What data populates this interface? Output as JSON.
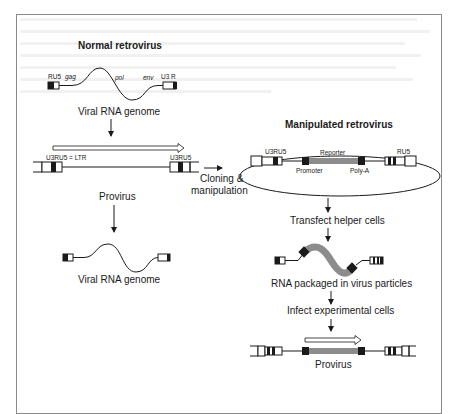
{
  "figure": {
    "left_column": {
      "title": "Normal retrovirus",
      "genome_labels": {
        "left_ltr": "RU5",
        "gag": "gag",
        "pol": "pol",
        "env": "env",
        "right_ltr": "U3 R"
      },
      "viral_rna_label_top": "Viral RNA genome",
      "provirus_ltr_left": "U3RU5 = LTR",
      "provirus_ltr_right": "U3RU5",
      "provirus_label": "Provirus",
      "viral_rna_label_bottom": "Viral RNA genome"
    },
    "transition": {
      "label_line1": "Cloning &",
      "label_line2": "manipulation"
    },
    "right_column": {
      "title": "Manipulated retrovirus",
      "ltr_left": "U3RU5",
      "ltr_right": "RU5",
      "reporter": "Reporter",
      "promoter": "Promoter",
      "polya": "Poly-A",
      "step1": "Transfect helper cells",
      "rna_label": "RNA packaged in virus particles",
      "step2": "Infect experimental cells",
      "provirus_label": "Provirus"
    },
    "colors": {
      "line": "#1a1a1a",
      "reporter_gray": "#8c8c8c",
      "frame": "#8a8a8a"
    }
  }
}
